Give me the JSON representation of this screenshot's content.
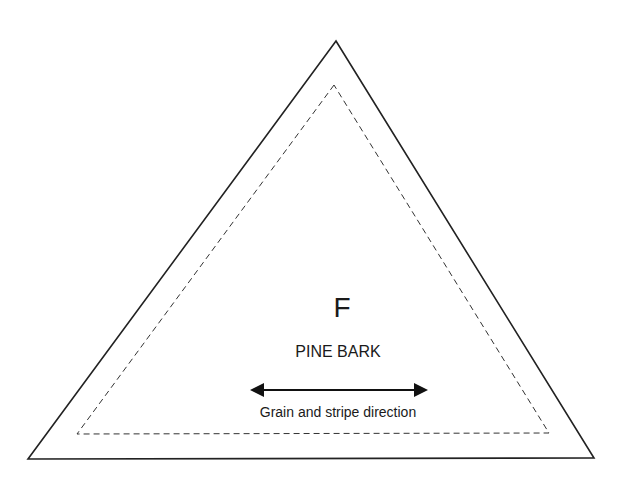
{
  "pattern_piece": {
    "letter": "F",
    "name": "PINE BARK",
    "grain_caption": "Grain and stripe direction"
  },
  "shapes": {
    "outer_triangle": {
      "points": "336,41 28,459 594,458",
      "stroke": "#222222"
    },
    "seam_allowance_triangle": {
      "points": "334,85 77,434 549,433",
      "stroke": "#333333",
      "dash": "6,4"
    },
    "grain_arrow": {
      "x1": 250,
      "x2": 428,
      "y": 390,
      "color": "#111111",
      "icon": "double-headed-arrow-icon"
    }
  }
}
